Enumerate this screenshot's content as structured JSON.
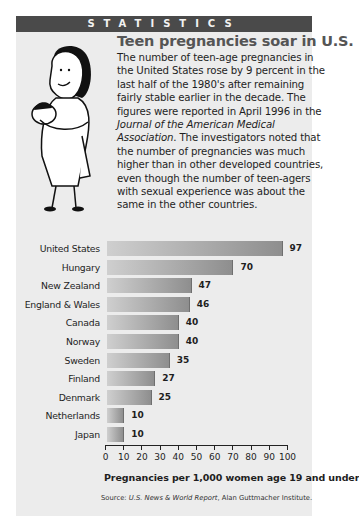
{
  "banner": {
    "label": "STATISTICS"
  },
  "article": {
    "headline": "Teen pregnancies soar in U.S.",
    "body_part1": "The number of teen-age pregnancies in the United States rose by 9 percent in the last half of the 1980's after remaining fairly stable earlier in the decade. The figures were reported in April 1996 in the ",
    "body_journal": "Journal of the American Medical Association",
    "body_part2": ". The investigators noted that the number of pregnancies was much higher than in other developed countries, even though the number of teen-agers with sexual experience was about the same in the other countries."
  },
  "illustration": {
    "icon": "mother-holding-baby-illustration"
  },
  "colors": {
    "banner_bg": "#4a4a4a",
    "panel_bg": "#ececec",
    "bar_light": "#cfcfcf",
    "bar_dark": "#8e8e8e"
  },
  "chart_data": {
    "type": "bar",
    "orientation": "horizontal",
    "title": "Teen pregnancies soar in U.S.",
    "categories": [
      "United States",
      "Hungary",
      "New Zealand",
      "England & Wales",
      "Canada",
      "Norway",
      "Sweden",
      "Finland",
      "Denmark",
      "Netherlands",
      "Japan"
    ],
    "values": [
      97,
      70,
      47,
      46,
      40,
      40,
      35,
      27,
      25,
      10,
      10
    ],
    "xlabel": "Pregnancies per 1,000 women age 19 and under",
    "ylabel": "",
    "xlim": [
      0,
      100
    ],
    "xticks": [
      "0",
      "10",
      "20",
      "30",
      "40",
      "50",
      "60",
      "70",
      "80",
      "90",
      "100"
    ],
    "grid": false,
    "legend": null,
    "source_prefix": "Source: ",
    "source_italic": "U.S. News & World Report",
    "source_suffix": ", Alan Guttmacher Institute."
  }
}
